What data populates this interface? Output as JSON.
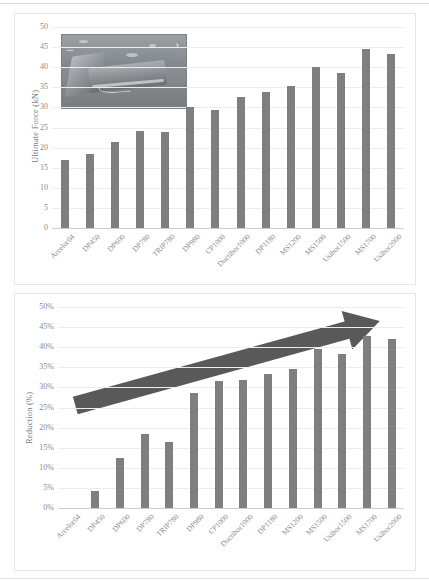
{
  "figure": {
    "categories": [
      "Arcelor04",
      "DP450",
      "DP600",
      "DP780",
      "TRIP780",
      "DP980",
      "CP1000",
      "Ductibor1000",
      "DP1180",
      "MS1200",
      "MS1500",
      "Usibor1500",
      "MS1700",
      "Usibor2000"
    ]
  },
  "chart_data": [
    {
      "type": "bar",
      "id": "ultimate-force",
      "title": "",
      "xlabel": "",
      "ylabel": "Ultimate Force (kN)",
      "categories": [
        "Arcelor04",
        "DP450",
        "DP600",
        "DP780",
        "TRIP780",
        "DP980",
        "CP1000",
        "Ductibor1000",
        "DP1180",
        "MS1200",
        "MS1500",
        "Usibor1500",
        "MS1700",
        "Usibor2000"
      ],
      "values": [
        17.0,
        18.5,
        21.3,
        24.2,
        24.0,
        30.1,
        29.3,
        32.6,
        33.8,
        35.2,
        40.1,
        38.5,
        44.5,
        43.2
      ],
      "ylim": [
        0,
        50
      ],
      "ytick_step": 5,
      "ytick_labels": [
        "0",
        "5",
        "10",
        "15",
        "20",
        "25",
        "30",
        "35",
        "40",
        "45",
        "50"
      ],
      "grid": true,
      "legend": "none",
      "bar_color": "#7f7f7f",
      "inset_image": {
        "name": "bent-metal-specimen-photo",
        "description": "Photograph of a folded/bent sheet metal specimen with a crack along the bend radius"
      }
    },
    {
      "type": "bar",
      "id": "reduction",
      "title": "",
      "xlabel": "",
      "ylabel": "Reduction (%)",
      "categories": [
        "Arcelor04",
        "DP450",
        "DP600",
        "DP780",
        "TRIP780",
        "DP980",
        "CP1000",
        "Ductibor1000",
        "DP1180",
        "MS1200",
        "MS1500",
        "Usibor1500",
        "MS1700",
        "Usibor2000"
      ],
      "values": [
        0.0,
        4.3,
        12.5,
        18.5,
        16.3,
        28.5,
        31.6,
        31.8,
        33.3,
        34.7,
        39.5,
        38.3,
        42.8,
        42.0
      ],
      "ylim": [
        0,
        50
      ],
      "ytick_step": 5,
      "ytick_labels": [
        "0%",
        "5%",
        "10%",
        "15%",
        "20%",
        "25%",
        "30%",
        "35%",
        "40%",
        "45%",
        "50%"
      ],
      "grid": true,
      "legend": "none",
      "bar_color": "#7f7f7f",
      "annotations": [
        {
          "name": "increasing-trend-arrow",
          "type": "arrow",
          "color": "#595959",
          "from_x": 0.05,
          "from_y": 25.5,
          "to_x": 0.93,
          "to_y": 46.5
        }
      ]
    }
  ]
}
